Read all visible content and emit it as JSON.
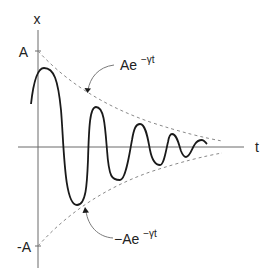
{
  "figure": {
    "axes": {
      "y_label": "x",
      "x_label": "t",
      "y_tick_top": "A",
      "y_tick_bottom": "-A"
    },
    "annotations": {
      "upper_envelope": {
        "base": "Ae",
        "exponent": "−γt"
      },
      "lower_envelope": {
        "base": "−Ae",
        "exponent": "−γt"
      }
    },
    "colors": {
      "curve": "#1a1a1a",
      "axes": "#6a6a6a",
      "envelope": "#8a8a8a",
      "text": "#222222"
    }
  }
}
